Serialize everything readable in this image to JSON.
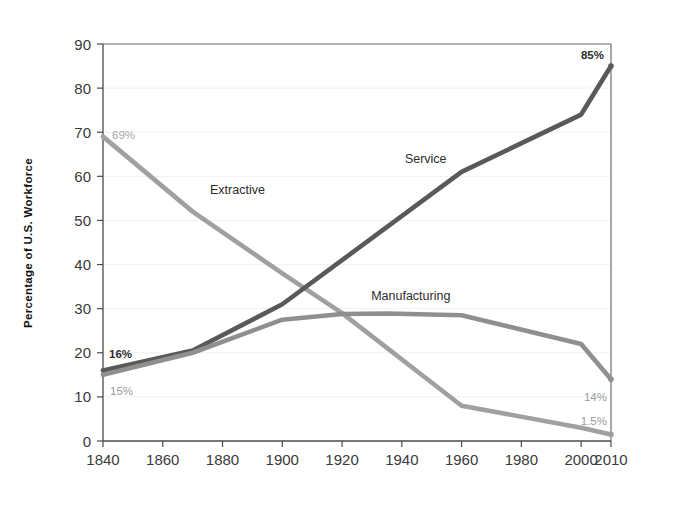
{
  "chart_data": {
    "type": "line",
    "title": "",
    "xlabel": "",
    "ylabel": "Percentage of U.S. Workforce",
    "xlim": [
      1840,
      2010
    ],
    "ylim": [
      0,
      90
    ],
    "grid": true,
    "legend_position": "inline-labels",
    "x_ticks": [
      "1840",
      "1860",
      "1880",
      "1900",
      "1920",
      "1940",
      "1960",
      "1980",
      "2000",
      "2010"
    ],
    "y_ticks": [
      "0",
      "10",
      "20",
      "30",
      "40",
      "50",
      "60",
      "70",
      "80",
      "90"
    ],
    "series": [
      {
        "name": "Extractive",
        "color": "#a0a0a0",
        "label_x": 1885,
        "label_y": 56,
        "x": [
          1840,
          1870,
          1900,
          1920,
          1960,
          2000,
          2010
        ],
        "values": [
          69,
          52,
          38,
          29,
          8,
          3,
          1.5
        ],
        "start_label": "69%",
        "end_label": "1.5%"
      },
      {
        "name": "Service",
        "color": "#595959",
        "label_x": 1948,
        "label_y": 63,
        "x": [
          1840,
          1870,
          1900,
          1960,
          2000,
          2010
        ],
        "values": [
          16,
          20.5,
          31,
          61,
          74,
          85
        ],
        "start_label": "16%",
        "end_label": "85%"
      },
      {
        "name": "Manufacturing",
        "color": "#8f8f8f",
        "label_x": 1943,
        "label_y": 32,
        "x": [
          1840,
          1870,
          1900,
          1920,
          1935,
          1960,
          2000,
          2010
        ],
        "values": [
          15,
          20,
          27.5,
          28.8,
          28.9,
          28.5,
          22,
          14
        ],
        "start_label": "15%",
        "end_label": "14%"
      }
    ],
    "annotations": [
      {
        "text": "69%",
        "series": "Extractive",
        "value": 69,
        "year": 1840,
        "style": "light"
      },
      {
        "text": "16%",
        "series": "Service",
        "value": 16,
        "year": 1840,
        "style": "bold"
      },
      {
        "text": "15%",
        "series": "Manufacturing",
        "value": 15,
        "year": 1840,
        "style": "mid"
      },
      {
        "text": "85%",
        "series": "Service",
        "value": 85,
        "year": 2010,
        "style": "bold"
      },
      {
        "text": "14%",
        "series": "Manufacturing",
        "value": 14,
        "year": 2010,
        "style": "mid"
      },
      {
        "text": "1.5%",
        "series": "Extractive",
        "value": 1.5,
        "year": 2010,
        "style": "mid"
      }
    ]
  }
}
